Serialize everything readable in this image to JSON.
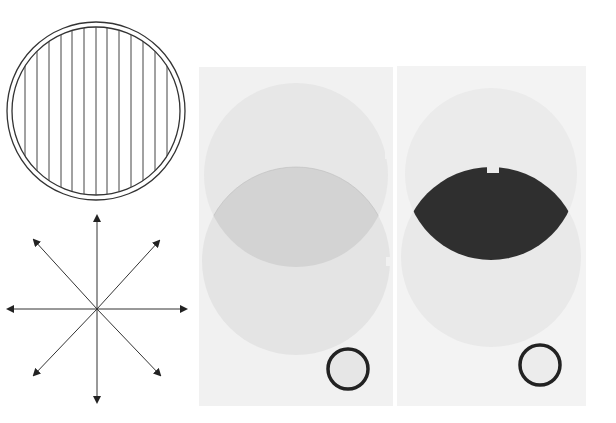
{
  "figure": {
    "polarizer_disc": {
      "line_count": 15,
      "stroke": "#333333"
    },
    "unpolarized_star": {
      "arrow_count": 8,
      "stroke": "#222222"
    },
    "panels": [
      {
        "id": "parallel",
        "overlap_color": "#d2d2d2",
        "disc_color": "#e6e6e6",
        "background": "#f1f1f1",
        "ring_color": "#222222"
      },
      {
        "id": "crossed",
        "overlap_color": "#2f2f2f",
        "disc_color": "#ececec",
        "background": "#f3f3f3",
        "ring_color": "#222222"
      }
    ]
  }
}
